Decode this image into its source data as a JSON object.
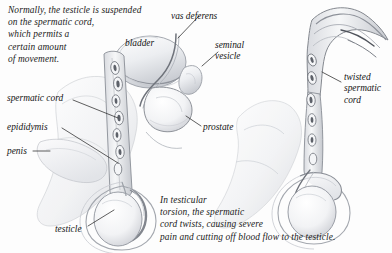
{
  "figure": {
    "width": 392,
    "height": 253,
    "background_color": "#fdfdfd",
    "ink_color": "#1b1b1b",
    "shading_color": "#b9bcc2"
  },
  "captions": {
    "intro": "Normally, the testicle is suspended\non the spermatic cord,\nwhich permits a\ncertain amount\nof movement.",
    "torsion": "In testicular\ntorsion, the spermatic\ncord twists, causing severe\npain and cutting off blood flow to the testicle."
  },
  "labels": {
    "vas_deferens": "vas deferens",
    "bladder": "bladder",
    "seminal_vesicle": "seminal\nvesicle",
    "prostate": "prostate",
    "spermatic_cord": "spermatic cord",
    "epididymis": "epididymis",
    "penis": "penis",
    "testicle": "testicle",
    "twisted_spermatic_cord": "twisted\nspermatic\ncord"
  },
  "panels": [
    {
      "name": "normal-anatomy",
      "description": "Left panel: normal male genitourinary anatomy in sagittal view with bladder, vas deferens, seminal vesicle, prostate, straight spermatic cord, epididymis, penis and testicle."
    },
    {
      "name": "torsion-anatomy",
      "description": "Right panel: testicular torsion with the spermatic cord twisted into a hooked coil above the testicle."
    }
  ]
}
